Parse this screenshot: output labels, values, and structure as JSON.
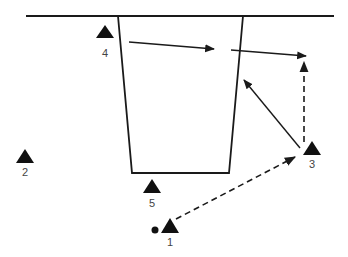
{
  "diagram": {
    "type": "site plan with stations and movement arrows",
    "colors": {
      "stroke": "#1a1a1a",
      "label": "#444444",
      "background": "#ffffff"
    },
    "stations": [
      {
        "id": "1",
        "label": "1",
        "x": 169,
        "y": 225
      },
      {
        "id": "2",
        "label": "2",
        "x": 25,
        "y": 157
      },
      {
        "id": "3",
        "label": "3",
        "x": 311,
        "y": 150
      },
      {
        "id": "4",
        "label": "4",
        "x": 105,
        "y": 32
      },
      {
        "id": "5",
        "label": "5",
        "x": 152,
        "y": 187
      }
    ],
    "marker_dot": {
      "near": "1",
      "x": 155,
      "y": 230
    },
    "arrows": [
      {
        "from": "4-area",
        "to": "trench-right",
        "style": "solid"
      },
      {
        "from": "trench-right",
        "to": "above-3",
        "style": "solid"
      },
      {
        "from": "1",
        "to": "3",
        "style": "dashed"
      },
      {
        "from": "3",
        "to": "top-right",
        "style": "dashed"
      },
      {
        "from": "3",
        "to": "trench-right-wall",
        "style": "solid"
      }
    ]
  }
}
